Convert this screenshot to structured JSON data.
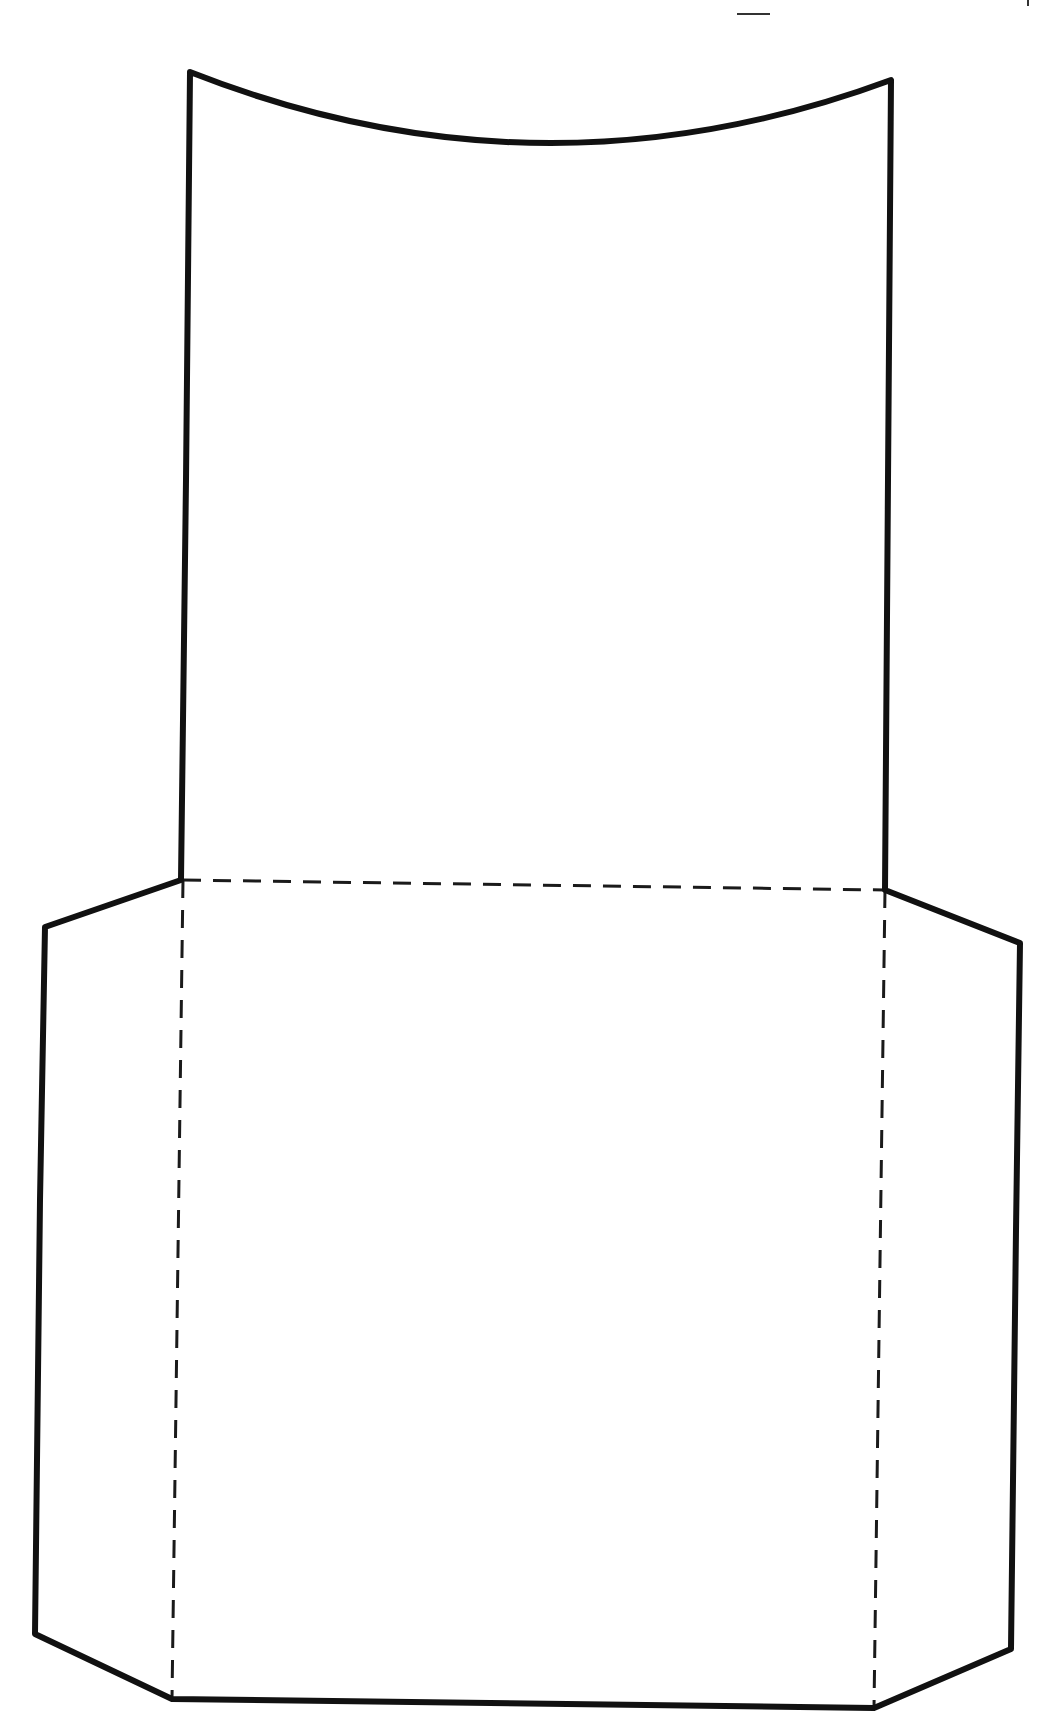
{
  "diagram": {
    "type": "printable-cutout-template",
    "description": "Pocket / envelope cut-and-fold template",
    "canvas": {
      "width": 1056,
      "height": 1729
    },
    "colors": {
      "background": "#ffffff",
      "cut_line": "#111111",
      "fold_line": "#1a1a1a",
      "crop_mark": "#333333"
    },
    "legend": {
      "cut_line": "solid outline (cut)",
      "fold_line": "dashed (fold)"
    },
    "outline_path": "M190,72 Q540,210 891,80 L888,480 L885,890 L1020,943 L1016,1230 L1011,1649 L874,1708 L172,1699 L35,1634 L40,1200 L45,927 L181,880 L186,480 Z",
    "fold_lines": [
      {
        "name": "fold-line-horizontal",
        "x1": 183,
        "y1": 880,
        "x2": 885,
        "y2": 890
      },
      {
        "name": "fold-line-left-vertical",
        "x1": 183,
        "y1": 880,
        "x2": 172,
        "y2": 1699
      },
      {
        "name": "fold-line-right-vertical",
        "x1": 885,
        "y1": 890,
        "x2": 874,
        "y2": 1708
      }
    ],
    "crop_marks": [
      {
        "name": "crop-mark-dash",
        "x1": 737,
        "y1": 14,
        "x2": 770,
        "y2": 14
      },
      {
        "name": "crop-mark-tick",
        "x1": 1028,
        "y1": 0,
        "x2": 1028,
        "y2": 6
      }
    ],
    "panels": [
      {
        "name": "top-panel",
        "label": "Top flap (curved edge)"
      },
      {
        "name": "front-panel",
        "label": "Front panel"
      },
      {
        "name": "left-side-flap",
        "label": "Left side flap"
      },
      {
        "name": "right-side-flap",
        "label": "Right side flap"
      }
    ]
  }
}
